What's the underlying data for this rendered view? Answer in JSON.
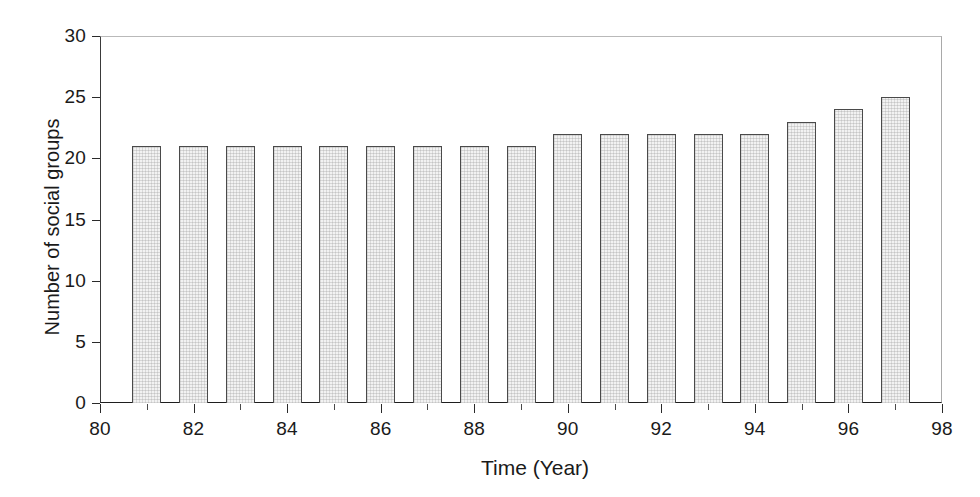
{
  "chart_data": {
    "type": "bar",
    "title": "",
    "subtitle": "",
    "xlabel": "Time (Year)",
    "ylabel": "Number of social groups",
    "categories": [
      1981,
      1982,
      1983,
      1984,
      1985,
      1986,
      1987,
      1988,
      1989,
      1990,
      1991,
      1992,
      1993,
      1994,
      1995,
      1996,
      1997
    ],
    "values": [
      21,
      21,
      21,
      21,
      21,
      21,
      21,
      21,
      21,
      22,
      22,
      22,
      22,
      22,
      23,
      24,
      25
    ],
    "series": [
      {
        "name": "Number of social groups",
        "values": [
          21,
          21,
          21,
          21,
          21,
          21,
          21,
          21,
          21,
          22,
          22,
          22,
          22,
          22,
          23,
          24,
          25
        ]
      }
    ],
    "xlim": [
      80,
      98
    ],
    "ylim": [
      0,
      30
    ],
    "x_major_ticks": [
      80,
      82,
      84,
      86,
      88,
      90,
      92,
      94,
      96,
      98
    ],
    "x_minor_ticks": [
      81,
      83,
      85,
      87,
      89,
      91,
      93,
      95,
      97
    ],
    "x_tick_labels": [
      "80",
      "82",
      "84",
      "86",
      "88",
      "90",
      "92",
      "94",
      "96",
      "98"
    ],
    "y_ticks": [
      0,
      5,
      10,
      15,
      20,
      25,
      30
    ],
    "y_tick_labels": [
      "0",
      "5",
      "10",
      "15",
      "20",
      "25",
      "30"
    ],
    "grid": false,
    "legend": null,
    "legend_position": "none",
    "annotations": [],
    "bar_fill_color": "#f2f2f2",
    "bar_edge_color": "#4a4a4a",
    "axis_color": "#1e1e1e",
    "background_color": "#ffffff",
    "text_color": "#1a1a1a"
  }
}
